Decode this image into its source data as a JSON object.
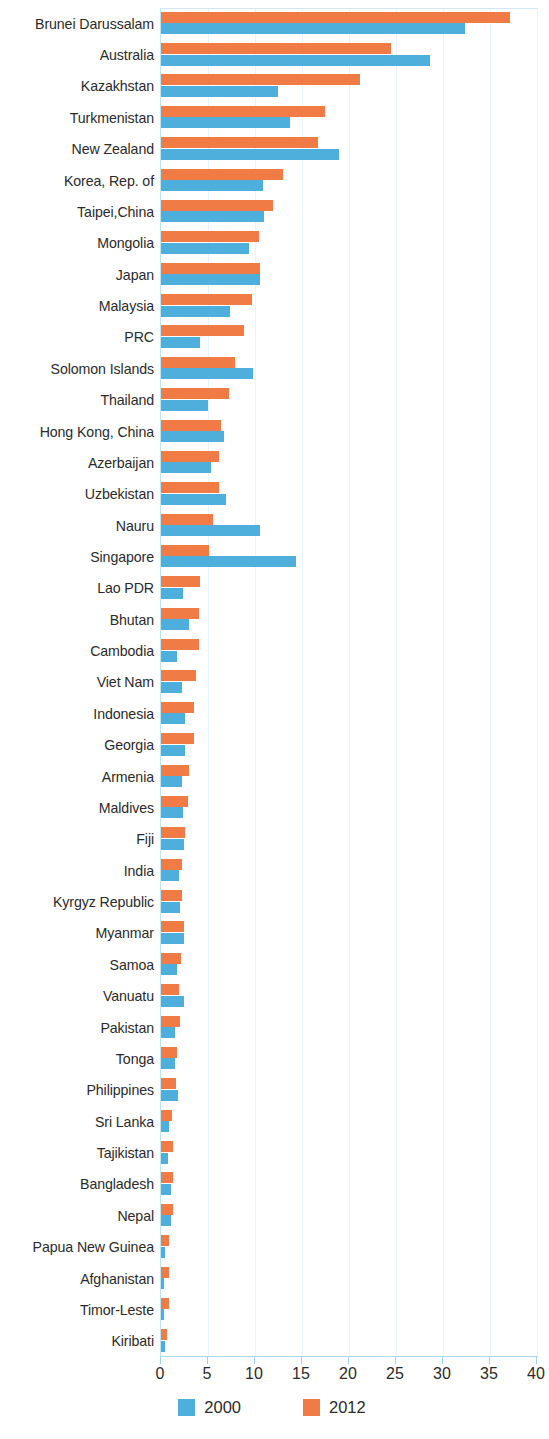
{
  "chart_data": {
    "type": "bar",
    "orientation": "horizontal",
    "title": "",
    "subtitle": "",
    "xlabel": "",
    "ylabel": "",
    "xlim": [
      0,
      40
    ],
    "xticks": [
      0,
      5,
      10,
      15,
      20,
      25,
      30,
      35,
      40
    ],
    "xtick_labels": [
      "0",
      "5",
      "10",
      "15",
      "20",
      "25",
      "30",
      "35",
      "40"
    ],
    "grid": true,
    "grid_axis": "x",
    "legend_position": "bottom",
    "colors": {
      "2000": "#4eaedc",
      "2012": "#f07b45"
    },
    "categories": [
      "Brunei Darussalam",
      "Australia",
      "Kazakhstan",
      "Turkmenistan",
      "New Zealand",
      "Korea, Rep. of",
      "Taipei,China",
      "Mongolia",
      "Japan",
      "Malaysia",
      "PRC",
      "Solomon Islands",
      "Thailand",
      "Hong Kong, China",
      "Azerbaijan",
      "Uzbekistan",
      "Nauru",
      "Singapore",
      "Lao PDR",
      "Bhutan",
      "Cambodia",
      "Viet Nam",
      "Indonesia",
      "Georgia",
      "Armenia",
      "Maldives",
      "Fiji",
      "India",
      "Kyrgyz Republic",
      "Myanmar",
      "Samoa",
      "Vanuatu",
      "Pakistan",
      "Tonga",
      "Philippines",
      "Sri Lanka",
      "Tajikistan",
      "Bangladesh",
      "Nepal",
      "Papua New Guinea",
      "Afghanistan",
      "Timor-Leste",
      "Kiribati"
    ],
    "series": [
      {
        "name": "2012",
        "color": "#f07b45",
        "values": [
          37.1,
          24.5,
          21.2,
          17.4,
          16.7,
          13.0,
          11.9,
          10.4,
          10.5,
          9.7,
          8.8,
          7.9,
          7.2,
          6.4,
          6.2,
          6.2,
          5.5,
          5.1,
          4.1,
          4.0,
          4.0,
          3.7,
          3.5,
          3.5,
          3.0,
          2.9,
          2.6,
          2.2,
          2.2,
          2.4,
          2.1,
          1.9,
          2.0,
          1.7,
          1.6,
          1.2,
          1.3,
          1.3,
          1.3,
          0.9,
          0.9,
          0.8,
          0.6
        ]
      },
      {
        "name": "2000",
        "color": "#4eaedc",
        "values": [
          32.3,
          28.6,
          12.4,
          13.7,
          18.9,
          10.8,
          11.0,
          9.4,
          10.5,
          7.3,
          4.1,
          9.8,
          5.0,
          6.7,
          5.3,
          6.9,
          10.5,
          14.4,
          2.3,
          3.0,
          1.7,
          2.2,
          2.5,
          2.6,
          2.2,
          2.3,
          2.4,
          1.9,
          2.0,
          2.4,
          1.7,
          2.4,
          1.5,
          1.5,
          1.8,
          0.9,
          0.7,
          1.1,
          1.1,
          0.4,
          0.3,
          0.3,
          0.4
        ]
      }
    ],
    "legend": [
      {
        "label": "2000",
        "color": "#4eaedc",
        "swatch": "legend-swatch-2000"
      },
      {
        "label": "2012",
        "color": "#f07b45",
        "swatch": "legend-swatch-2012"
      }
    ]
  }
}
